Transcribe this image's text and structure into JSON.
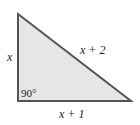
{
  "diagram": {
    "type": "right-triangle",
    "fill_color": "#e6e6e6",
    "stroke_color": "#555555",
    "vertices": {
      "top": [
        18,
        14
      ],
      "right_angle": [
        18,
        101
      ],
      "bottom_right": [
        131,
        101
      ]
    },
    "labels": {
      "left_side": "x",
      "hypotenuse": "x + 2",
      "bottom_side": "x + 1",
      "right_angle": "90°"
    }
  }
}
